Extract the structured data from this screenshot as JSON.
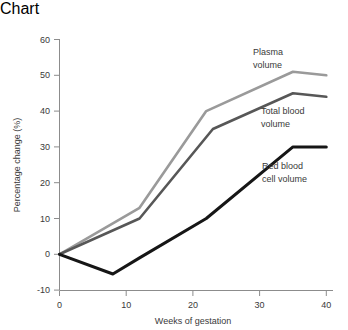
{
  "chart_data": {
    "type": "line",
    "title": "",
    "xlabel": "Weeks of gestation",
    "ylabel": "Percentage change (%)",
    "xlim": [
      0,
      42
    ],
    "ylim": [
      -10,
      60
    ],
    "xticks": [
      0,
      10,
      20,
      30,
      40
    ],
    "xtick_labels": [
      "0",
      "10",
      "20",
      "30",
      "40"
    ],
    "yticks": [
      -10,
      0,
      10,
      20,
      30,
      40,
      50,
      60
    ],
    "ytick_labels": [
      "-10",
      "0",
      "10",
      "20",
      "30",
      "40",
      "50",
      "60"
    ],
    "grid": false,
    "legend": "inline-annotations",
    "series": [
      {
        "name": "Plasma volume",
        "color": "#9a9a9a",
        "label_lines": [
          "Plasma",
          "volume"
        ],
        "x": [
          0,
          12,
          22,
          35,
          40
        ],
        "values": [
          0,
          13,
          40,
          51,
          50
        ]
      },
      {
        "name": "Total blood volume",
        "color": "#575757",
        "label_lines": [
          "Total blood",
          "volume"
        ],
        "x": [
          0,
          12,
          23,
          35,
          40
        ],
        "values": [
          0,
          10,
          35,
          45,
          44
        ]
      },
      {
        "name": "Red blood cell volume",
        "color": "#161616",
        "label_lines": [
          "Red blood",
          "cell volume"
        ],
        "x": [
          0,
          8,
          12,
          22,
          35,
          40
        ],
        "values": [
          0,
          -5.5,
          -1,
          10,
          30,
          30
        ]
      }
    ],
    "axis_color": "#8c8c8c",
    "text_color": "#3a3a3a"
  },
  "labels": {
    "plasma_line1": "Plasma",
    "plasma_line2": "volume",
    "total_line1": "Total blood",
    "total_line2": "volume",
    "rbc_line1": "Red blood",
    "rbc_line2": "cell volume",
    "xaxis": "Weeks of gestation",
    "yaxis": "Percentage change (%)",
    "y60": "60",
    "y50": "50",
    "y40": "40",
    "y30": "30",
    "y20": "20",
    "y10": "10",
    "y0": "0",
    "ym10": "-10",
    "x0": "0",
    "x10": "10",
    "x20": "20",
    "x30": "30",
    "x40": "40"
  }
}
